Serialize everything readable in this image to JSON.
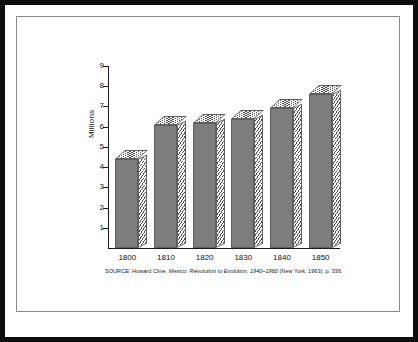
{
  "figure": {
    "frame_color": "#0d0d0d",
    "inner_rule_color": "#8c8c8c",
    "background": "#ffffff"
  },
  "source_note": {
    "label": "SOURCE:",
    "author": "Howard Cline,",
    "title_italic": "Mexico: Revolution to Evolution, 1940–1960",
    "publication": "(New York, 1963), p. 336."
  },
  "chart_data": {
    "type": "bar",
    "title": "",
    "subtitle": "",
    "xlabel": "",
    "ylabel": "Millions",
    "categories": [
      "1800",
      "1810",
      "1820",
      "1830",
      "1840",
      "1850"
    ],
    "values": [
      4.4,
      6.1,
      6.2,
      6.4,
      6.9,
      7.6
    ],
    "series": [
      {
        "name": "Population",
        "values": [
          4.4,
          6.1,
          6.2,
          6.4,
          6.9,
          7.6
        ]
      }
    ],
    "ylim": [
      0,
      9
    ],
    "yticks": [
      1,
      2,
      3,
      4,
      5,
      6,
      7,
      8,
      9
    ],
    "ytick_labels": [
      "1",
      "2",
      "3",
      "4",
      "5",
      "6",
      "7",
      "8",
      "9"
    ],
    "grid": false,
    "legend": null,
    "style": "3d-bar",
    "bar_face_color": "#7d7d7d",
    "bar_hatch_color": "#4a4a4a",
    "axis_color": "#1a1a1a"
  }
}
